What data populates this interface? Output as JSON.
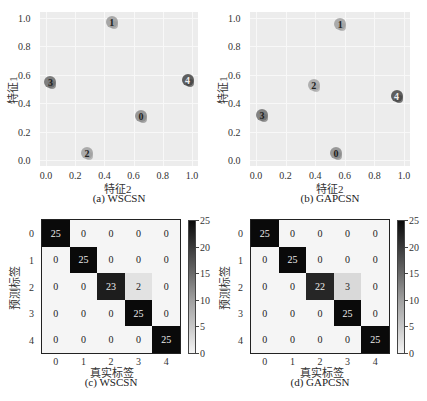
{
  "chart_data": [
    {
      "id": "a",
      "type": "scatter",
      "caption": "(a) WSCSN",
      "xlabel": "特征2",
      "ylabel": "特征1",
      "xlim": [
        0,
        1
      ],
      "ylim": [
        0,
        1
      ],
      "xticks": [
        "0.0",
        "0.2",
        "0.4",
        "0.6",
        "0.8",
        "1.0"
      ],
      "yticks": [
        "0.0",
        "0.2",
        "0.4",
        "0.6",
        "0.8",
        "1.0"
      ],
      "grid": true,
      "clusters": [
        {
          "label": "0",
          "x": 0.65,
          "y": 0.31,
          "color": "#8a8a8a"
        },
        {
          "label": "1",
          "x": 0.45,
          "y": 0.97,
          "color": "#9a9a9a"
        },
        {
          "label": "2",
          "x": 0.28,
          "y": 0.05,
          "color": "#a0a0a0"
        },
        {
          "label": "3",
          "x": 0.03,
          "y": 0.55,
          "color": "#6a6a6a"
        },
        {
          "label": "4",
          "x": 0.97,
          "y": 0.56,
          "color": "#444444"
        }
      ]
    },
    {
      "id": "b",
      "type": "scatter",
      "caption": "(b) GAPCSN",
      "xlabel": "特征2",
      "ylabel": "特征1",
      "xlim": [
        0,
        1
      ],
      "ylim": [
        0,
        1
      ],
      "xticks": [
        "0.0",
        "0.2",
        "0.4",
        "0.6",
        "0.8",
        "1.0"
      ],
      "yticks": [
        "0.0",
        "0.2",
        "0.4",
        "0.6",
        "0.8",
        "1.0"
      ],
      "grid": true,
      "clusters": [
        {
          "label": "0",
          "x": 0.54,
          "y": 0.05,
          "color": "#8a8a8a"
        },
        {
          "label": "1",
          "x": 0.57,
          "y": 0.96,
          "color": "#a0a0a0"
        },
        {
          "label": "2",
          "x": 0.39,
          "y": 0.53,
          "color": "#a5a5a5"
        },
        {
          "label": "3",
          "x": 0.04,
          "y": 0.32,
          "color": "#707070"
        },
        {
          "label": "4",
          "x": 0.95,
          "y": 0.45,
          "color": "#454545"
        }
      ]
    },
    {
      "id": "c",
      "type": "heatmap",
      "caption": "(c) WSCSN",
      "xlabel": "真实标签",
      "ylabel": "预测标签",
      "xticks": [
        "0",
        "1",
        "2",
        "3",
        "4"
      ],
      "yticks": [
        "0",
        "1",
        "2",
        "3",
        "4"
      ],
      "matrix": [
        [
          25,
          0,
          0,
          0,
          0
        ],
        [
          0,
          25,
          0,
          0,
          0
        ],
        [
          0,
          0,
          23,
          2,
          0
        ],
        [
          0,
          0,
          0,
          25,
          0
        ],
        [
          0,
          0,
          0,
          0,
          25
        ]
      ],
      "colorbar": {
        "min": 0,
        "max": 25,
        "ticks": [
          "0",
          "5",
          "10",
          "15",
          "20",
          "25"
        ]
      }
    },
    {
      "id": "d",
      "type": "heatmap",
      "caption": "(d) GAPCSN",
      "xlabel": "真实标签",
      "ylabel": "预测标签",
      "xticks": [
        "0",
        "1",
        "2",
        "3",
        "4"
      ],
      "yticks": [
        "0",
        "1",
        "2",
        "3",
        "4"
      ],
      "matrix": [
        [
          25,
          0,
          0,
          0,
          0
        ],
        [
          0,
          25,
          0,
          0,
          0
        ],
        [
          0,
          0,
          22,
          3,
          0
        ],
        [
          0,
          0,
          0,
          25,
          0
        ],
        [
          0,
          0,
          0,
          0,
          25
        ]
      ],
      "colorbar": {
        "min": 0,
        "max": 25,
        "ticks": [
          "0",
          "5",
          "10",
          "15",
          "20",
          "25"
        ]
      }
    }
  ]
}
